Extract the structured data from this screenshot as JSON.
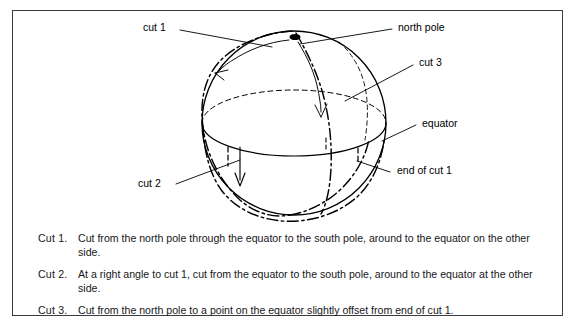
{
  "figure": {
    "type": "sphere-cut-diagram",
    "frame_color": "#3b3b40",
    "line_color": "#000000",
    "background": "#ffffff",
    "labels": [
      {
        "id": "cut-1",
        "text": "cut 1",
        "x": 143,
        "y": 27
      },
      {
        "id": "north-pole",
        "text": "north pole",
        "x": 398,
        "y": 27
      },
      {
        "id": "cut-3",
        "text": "cut 3",
        "x": 419,
        "y": 62
      },
      {
        "id": "equator",
        "text": "equator",
        "x": 422,
        "y": 122
      },
      {
        "id": "end-of-cut-1",
        "text": "end of cut  1",
        "x": 397,
        "y": 169
      },
      {
        "id": "cut-2",
        "text": "cut  2",
        "x": 138,
        "y": 182
      }
    ],
    "sphere": {
      "cx": 294,
      "cy": 123,
      "r": 92,
      "north_pole_marker": true,
      "equator_back_style": "dashed",
      "equator_front_style": "solid",
      "cut_style": "dash-dot"
    }
  },
  "captions": [
    {
      "key": "Cut  1.",
      "text": "Cut from the north pole through the equator to the south pole, around to the equator on the other side."
    },
    {
      "key": "Cut  2.",
      "text": "At a right angle to cut 1, cut from the equator to the south pole, around to the equator at the other side."
    },
    {
      "key": "Cut  3.",
      "text": "Cut from the north pole to a point on the equator slightly offset from end of cut 1."
    }
  ]
}
